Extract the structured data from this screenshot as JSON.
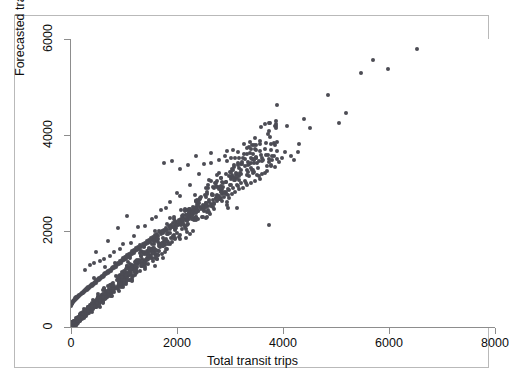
{
  "figure": {
    "caption": "",
    "background": "#ffffff",
    "frame_color": "#b9b9b9",
    "marker_color": "#4c4c54",
    "grid_color": "#f0f0f2",
    "axis_color": "#8d8d8d"
  },
  "chart_data": {
    "type": "scatter",
    "title": "",
    "xlabel": "Total transit trips",
    "ylabel": "Forecasted transit trips",
    "xlim": [
      0,
      8000
    ],
    "ylim": [
      0,
      6000
    ],
    "xticks": [
      0,
      2000,
      4000,
      6000,
      8000
    ],
    "yticks": [
      0,
      2000,
      4000,
      6000
    ],
    "xticklabels": [
      "0",
      "2000",
      "4000",
      "6000",
      "8000"
    ],
    "yticklabels": [
      "0",
      "2000",
      "4000",
      "6000"
    ],
    "grid": "horizontal",
    "legend": null,
    "marker": "filled-circle",
    "marker_size": 4,
    "n_points": 1250,
    "points": [
      [
        6520,
        5790
      ],
      [
        5980,
        5380
      ],
      [
        5700,
        5560
      ],
      [
        5480,
        5290
      ],
      [
        5180,
        4460
      ],
      [
        5050,
        4260
      ],
      [
        4840,
        4840
      ],
      [
        4510,
        4150
      ],
      [
        4400,
        4340
      ],
      [
        4300,
        3820
      ],
      [
        4280,
        3650
      ],
      [
        4210,
        3470
      ],
      [
        4150,
        3560
      ],
      [
        4080,
        4190
      ],
      [
        4040,
        3640
      ],
      [
        3980,
        3520
      ],
      [
        3930,
        3440
      ],
      [
        3880,
        3510
      ],
      [
        3840,
        3330
      ],
      [
        3800,
        3470
      ],
      [
        3770,
        3380
      ],
      [
        3740,
        2130
      ],
      [
        3700,
        3260
      ],
      [
        3660,
        3200
      ],
      [
        3610,
        3180
      ],
      [
        3560,
        3090
      ],
      [
        3520,
        3320
      ],
      [
        3480,
        3050
      ],
      [
        3440,
        3280
      ],
      [
        3400,
        2990
      ],
      [
        3360,
        3140
      ],
      [
        3320,
        2960
      ],
      [
        3280,
        3050
      ],
      [
        3250,
        2900
      ],
      [
        3210,
        3000
      ],
      [
        3170,
        2880
      ],
      [
        3140,
        2950
      ],
      [
        3100,
        2820
      ],
      [
        3060,
        2900
      ],
      [
        3030,
        2780
      ],
      [
        2990,
        2860
      ],
      [
        2960,
        2740
      ],
      [
        2920,
        2810
      ],
      [
        2890,
        2700
      ],
      [
        2850,
        2770
      ],
      [
        2820,
        2660
      ],
      [
        2790,
        2730
      ],
      [
        2760,
        2620
      ],
      [
        2730,
        2690
      ],
      [
        2700,
        2590
      ],
      [
        2670,
        2650
      ],
      [
        2640,
        2560
      ],
      [
        2610,
        2610
      ],
      [
        2580,
        2520
      ],
      [
        2550,
        2580
      ],
      [
        2520,
        2490
      ],
      [
        2490,
        2540
      ],
      [
        2460,
        2450
      ],
      [
        2430,
        2500
      ],
      [
        2400,
        2420
      ],
      [
        2380,
        2470
      ],
      [
        2350,
        2380
      ],
      [
        2320,
        2430
      ],
      [
        2300,
        2350
      ],
      [
        2270,
        2400
      ],
      [
        2250,
        2320
      ],
      [
        2220,
        2360
      ],
      [
        2200,
        2280
      ],
      [
        2170,
        2330
      ],
      [
        2150,
        2250
      ],
      [
        2120,
        2290
      ],
      [
        2100,
        2220
      ],
      [
        2080,
        2260
      ],
      [
        2050,
        2180
      ],
      [
        2030,
        2230
      ],
      [
        2000,
        2150
      ],
      [
        1980,
        2190
      ],
      [
        1960,
        2120
      ],
      [
        1930,
        2160
      ],
      [
        1910,
        2090
      ],
      [
        1890,
        2130
      ],
      [
        1860,
        2050
      ],
      [
        1840,
        2100
      ],
      [
        1820,
        2020
      ],
      [
        1800,
        2060
      ],
      [
        1780,
        1990
      ],
      [
        1750,
        2030
      ],
      [
        1730,
        1960
      ],
      [
        1710,
        2000
      ],
      [
        1690,
        1930
      ],
      [
        1670,
        1970
      ],
      [
        1650,
        1900
      ],
      [
        1630,
        1940
      ],
      [
        1610,
        1870
      ],
      [
        1590,
        1910
      ],
      [
        1570,
        1840
      ],
      [
        1550,
        1880
      ],
      [
        1530,
        1810
      ],
      [
        1510,
        1850
      ],
      [
        1490,
        1780
      ],
      [
        1470,
        1820
      ],
      [
        1450,
        1750
      ],
      [
        1430,
        1790
      ],
      [
        1410,
        1720
      ],
      [
        1390,
        1760
      ],
      [
        1370,
        1690
      ],
      [
        1350,
        1730
      ],
      [
        1330,
        1660
      ],
      [
        1310,
        1700
      ],
      [
        1290,
        1630
      ],
      [
        1270,
        1670
      ],
      [
        1250,
        1600
      ],
      [
        1230,
        1640
      ],
      [
        1215,
        1575
      ],
      [
        1195,
        1610
      ],
      [
        1180,
        1545
      ],
      [
        1160,
        1580
      ],
      [
        1145,
        1515
      ],
      [
        1125,
        1550
      ],
      [
        1110,
        1485
      ],
      [
        1090,
        1520
      ],
      [
        1075,
        1455
      ],
      [
        1055,
        1490
      ],
      [
        1040,
        1425
      ],
      [
        1020,
        1460
      ],
      [
        1005,
        1400
      ],
      [
        990,
        1430
      ],
      [
        970,
        1370
      ],
      [
        955,
        1400
      ],
      [
        940,
        1340
      ],
      [
        920,
        1370
      ],
      [
        905,
        1310
      ],
      [
        890,
        1340
      ],
      [
        875,
        1285
      ],
      [
        855,
        1310
      ],
      [
        840,
        1255
      ],
      [
        825,
        1280
      ],
      [
        810,
        1225
      ],
      [
        795,
        1250
      ],
      [
        780,
        1200
      ],
      [
        765,
        1225
      ],
      [
        750,
        1170
      ],
      [
        735,
        1195
      ],
      [
        720,
        1145
      ],
      [
        705,
        1170
      ],
      [
        690,
        1120
      ],
      [
        675,
        1145
      ],
      [
        660,
        1095
      ],
      [
        645,
        1120
      ],
      [
        630,
        1070
      ],
      [
        615,
        1095
      ],
      [
        600,
        1045
      ],
      [
        590,
        1070
      ],
      [
        575,
        1020
      ],
      [
        560,
        1045
      ],
      [
        545,
        995
      ],
      [
        530,
        1020
      ],
      [
        520,
        975
      ],
      [
        505,
        995
      ],
      [
        490,
        950
      ],
      [
        480,
        970
      ],
      [
        465,
        925
      ],
      [
        450,
        945
      ],
      [
        440,
        900
      ],
      [
        425,
        920
      ],
      [
        415,
        880
      ],
      [
        400,
        900
      ],
      [
        390,
        855
      ],
      [
        375,
        875
      ],
      [
        365,
        835
      ],
      [
        350,
        855
      ],
      [
        340,
        815
      ],
      [
        330,
        835
      ],
      [
        315,
        795
      ],
      [
        305,
        815
      ],
      [
        295,
        775
      ],
      [
        280,
        795
      ],
      [
        270,
        755
      ],
      [
        260,
        775
      ],
      [
        250,
        735
      ],
      [
        240,
        755
      ],
      [
        230,
        715
      ],
      [
        220,
        735
      ],
      [
        210,
        700
      ],
      [
        200,
        715
      ],
      [
        190,
        680
      ],
      [
        180,
        695
      ],
      [
        170,
        660
      ],
      [
        160,
        675
      ],
      [
        150,
        640
      ],
      [
        140,
        655
      ],
      [
        130,
        620
      ],
      [
        120,
        635
      ],
      [
        110,
        600
      ],
      [
        100,
        615
      ],
      [
        90,
        580
      ],
      [
        80,
        595
      ],
      [
        70,
        560
      ],
      [
        60,
        570
      ],
      [
        50,
        540
      ],
      [
        45,
        550
      ],
      [
        38,
        520
      ],
      [
        32,
        530
      ],
      [
        26,
        500
      ],
      [
        20,
        510
      ],
      [
        16,
        480
      ],
      [
        12,
        490
      ],
      [
        9,
        460
      ],
      [
        6,
        470
      ],
      [
        4,
        440
      ],
      [
        430,
        1330
      ],
      [
        620,
        1420
      ],
      [
        810,
        1560
      ],
      [
        990,
        1720
      ],
      [
        1180,
        1890
      ],
      [
        1400,
        2100
      ],
      [
        1600,
        2300
      ],
      [
        1800,
        2480
      ],
      [
        2050,
        2720
      ],
      [
        2250,
        2960
      ],
      [
        2420,
        3180
      ],
      [
        2650,
        3420
      ],
      [
        2900,
        3570
      ],
      [
        3150,
        3640
      ],
      [
        3350,
        3740
      ],
      [
        1750,
        3420
      ],
      [
        1900,
        3460
      ],
      [
        2050,
        3300
      ],
      [
        2200,
        3380
      ],
      [
        2350,
        3560
      ],
      [
        2500,
        3400
      ],
      [
        2650,
        3620
      ],
      [
        2800,
        3480
      ],
      [
        2950,
        3660
      ],
      [
        3100,
        3520
      ],
      [
        480,
        1560
      ],
      [
        700,
        1790
      ],
      [
        880,
        2060
      ],
      [
        1050,
        2320
      ],
      [
        1270,
        2080
      ],
      [
        1520,
        2250
      ],
      [
        1690,
        2430
      ],
      [
        1870,
        2600
      ],
      [
        2000,
        2800
      ],
      [
        2150,
        2460
      ],
      [
        260,
        1180
      ],
      [
        350,
        1290
      ],
      [
        440,
        1020
      ],
      [
        540,
        1380
      ],
      [
        640,
        1240
      ],
      [
        730,
        1480
      ],
      [
        830,
        1330
      ],
      [
        930,
        1620
      ],
      [
        1030,
        1460
      ],
      [
        1130,
        1750
      ]
    ]
  }
}
